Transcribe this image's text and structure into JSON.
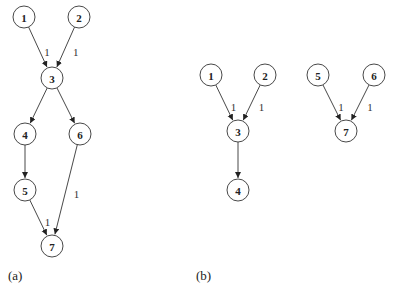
{
  "graphs": [
    {
      "caption": "(a)",
      "nodes": [
        {
          "id": "1",
          "x": 24,
          "y": 17
        },
        {
          "id": "2",
          "x": 79,
          "y": 17
        },
        {
          "id": "3",
          "x": 52,
          "y": 78
        },
        {
          "id": "4",
          "x": 25,
          "y": 134
        },
        {
          "id": "6",
          "x": 80,
          "y": 134
        },
        {
          "id": "5",
          "x": 25,
          "y": 190
        },
        {
          "id": "7",
          "x": 52,
          "y": 246
        }
      ],
      "edges": [
        {
          "from": "1",
          "to": "3",
          "weight": "1"
        },
        {
          "from": "2",
          "to": "3",
          "weight": "1"
        },
        {
          "from": "3",
          "to": "4",
          "weight": ""
        },
        {
          "from": "3",
          "to": "6",
          "weight": ""
        },
        {
          "from": "4",
          "to": "5",
          "weight": ""
        },
        {
          "from": "5",
          "to": "7",
          "weight": "1"
        },
        {
          "from": "6",
          "to": "7",
          "weight": "1"
        }
      ]
    },
    {
      "caption": "(b)",
      "nodes": [
        {
          "id": "1",
          "x": 211,
          "y": 75
        },
        {
          "id": "2",
          "x": 265,
          "y": 75
        },
        {
          "id": "3",
          "x": 238,
          "y": 131
        },
        {
          "id": "4",
          "x": 238,
          "y": 190
        },
        {
          "id": "5",
          "x": 318,
          "y": 75
        },
        {
          "id": "6",
          "x": 374,
          "y": 75
        },
        {
          "id": "7",
          "x": 346,
          "y": 131
        }
      ],
      "edges": [
        {
          "from": "1",
          "to": "3",
          "weight": "1"
        },
        {
          "from": "2",
          "to": "3",
          "weight": "1"
        },
        {
          "from": "3",
          "to": "4",
          "weight": ""
        },
        {
          "from": "5",
          "to": "7",
          "weight": "1"
        },
        {
          "from": "6",
          "to": "7",
          "weight": "1"
        }
      ]
    }
  ],
  "captions": {
    "a": "(a)",
    "b": "(b)"
  },
  "style": {
    "node_radius": 11,
    "stroke": "#333333"
  }
}
